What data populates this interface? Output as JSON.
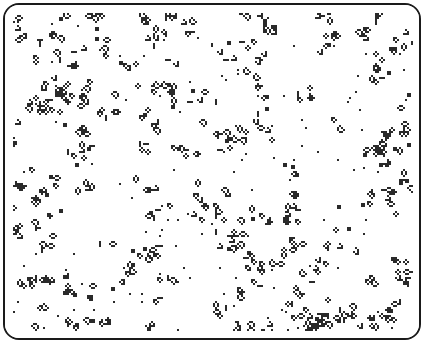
{
  "board": {
    "width": 414,
    "height": 333,
    "cell_size": 2,
    "border_color": "#1a1a1a",
    "background": "#ffffff",
    "cell_color": "#2a2a2a",
    "seed": 1337,
    "cluster_count": 230,
    "isolated_cells": 160,
    "density_note": "dense scattered clusters of live cells (blinkers, blocks, beehives, loaves, gliders)"
  }
}
